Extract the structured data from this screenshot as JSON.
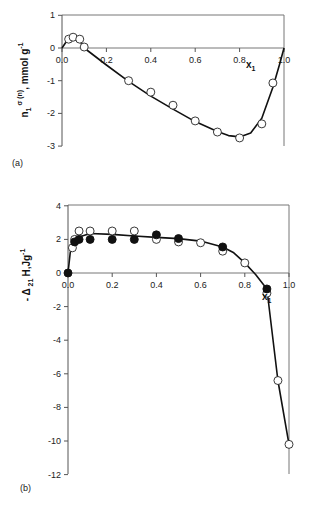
{
  "chart_data": [
    {
      "type": "scatter",
      "panel_label": "(a)",
      "title": "",
      "xlabel": "x",
      "xlabel_sub": "1",
      "ylabel_main": "n",
      "ylabel_sub": "1",
      "ylabel_sup": "σ (n)",
      "ylabel_unit": ", mmol g",
      "ylabel_unit_sup": "-1",
      "xlim": [
        0,
        1.0
      ],
      "ylim": [
        -3,
        1
      ],
      "x_ticks": [
        0.0,
        0.2,
        0.4,
        0.6,
        0.8,
        1.0
      ],
      "x_tick_labels": [
        "0.0",
        "0.2",
        "0.4",
        "0.6",
        "0.8",
        "1.0"
      ],
      "y_ticks": [
        1,
        0,
        -1,
        -2,
        -3
      ],
      "y_tick_labels": [
        "1",
        "0",
        "-1",
        "-2",
        "-3"
      ],
      "grid": false,
      "series": [
        {
          "name": "experimental (open circles)",
          "marker": "open-circle",
          "x": [
            0.03,
            0.05,
            0.08,
            0.1,
            0.3,
            0.4,
            0.5,
            0.6,
            0.7,
            0.8,
            0.9,
            0.95
          ],
          "y": [
            0.27,
            0.33,
            0.27,
            0.03,
            -1.0,
            -1.35,
            -1.75,
            -2.23,
            -2.57,
            -2.75,
            -2.32,
            -1.07
          ]
        },
        {
          "name": "fitted curve",
          "marker": "line",
          "x": [
            0.0,
            0.02,
            0.05,
            0.08,
            0.1,
            0.2,
            0.3,
            0.4,
            0.5,
            0.6,
            0.7,
            0.75,
            0.8,
            0.85,
            0.9,
            0.95,
            0.98,
            1.0
          ],
          "y": [
            0.0,
            0.2,
            0.3,
            0.22,
            0.0,
            -0.52,
            -1.02,
            -1.47,
            -1.87,
            -2.25,
            -2.55,
            -2.68,
            -2.72,
            -2.6,
            -2.15,
            -1.2,
            -0.5,
            0.0
          ]
        }
      ]
    },
    {
      "type": "scatter",
      "panel_label": "(b)",
      "title": "",
      "xlabel": "x",
      "xlabel_sub": "1",
      "ylabel_main": "- Δ",
      "ylabel_sub": "21",
      "ylabel_unit": "H,Jg",
      "ylabel_unit_sup": "-1",
      "xlim": [
        0,
        1.0
      ],
      "ylim": [
        -12,
        4
      ],
      "x_ticks": [
        0.0,
        0.2,
        0.4,
        0.6,
        0.8,
        1.0
      ],
      "x_tick_labels": [
        "0.0",
        "0.2",
        "0.4",
        "0.6",
        "0.8",
        "1.0"
      ],
      "y_ticks": [
        4,
        2,
        0,
        -2,
        -4,
        -6,
        -8,
        -10,
        -12
      ],
      "y_tick_labels": [
        "4",
        "2",
        "0",
        "-2",
        "-4",
        "-6",
        "-8",
        "-10",
        "-12"
      ],
      "grid": false,
      "series": [
        {
          "name": "open circles",
          "marker": "open-circle",
          "x": [
            0.02,
            0.03,
            0.05,
            0.1,
            0.2,
            0.3,
            0.4,
            0.5,
            0.6,
            0.7,
            0.8,
            0.9,
            0.95,
            1.0
          ],
          "y": [
            1.5,
            2.0,
            2.5,
            2.5,
            2.5,
            2.5,
            2.0,
            1.85,
            1.8,
            1.3,
            0.6,
            -1.2,
            -6.4,
            -10.2
          ]
        },
        {
          "name": "filled circles",
          "marker": "filled-circle",
          "x": [
            0.0,
            0.03,
            0.05,
            0.1,
            0.2,
            0.3,
            0.4,
            0.5,
            0.7,
            0.9
          ],
          "y": [
            0.0,
            1.85,
            2.0,
            2.0,
            2.0,
            2.0,
            2.27,
            2.05,
            1.55,
            -0.95
          ]
        },
        {
          "name": "fitted curve",
          "marker": "line",
          "x": [
            0.0,
            0.01,
            0.02,
            0.03,
            0.05,
            0.1,
            0.2,
            0.3,
            0.4,
            0.5,
            0.6,
            0.7,
            0.75,
            0.8,
            0.85,
            0.9,
            0.95,
            1.0
          ],
          "y": [
            0.0,
            1.2,
            1.6,
            1.85,
            2.15,
            2.35,
            2.3,
            2.2,
            2.12,
            2.05,
            1.9,
            1.55,
            1.2,
            0.6,
            -0.1,
            -0.95,
            -6.4,
            -10.2
          ]
        }
      ]
    }
  ],
  "layout": {
    "panels": [
      {
        "x0": 62,
        "x1": 284,
        "yTop": 15,
        "yZero": 48,
        "yBottom": 146,
        "pxPerUnit": 32.7,
        "xAxisY": 48,
        "frameTop": 15
      },
      {
        "x0": 68,
        "x1": 289,
        "yTop": 205,
        "yZero": 273,
        "yBottom": 474,
        "pxPerUnit": 16.8,
        "xAxisY": 273,
        "frameTop": 205
      }
    ]
  }
}
